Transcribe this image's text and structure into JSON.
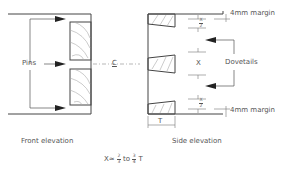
{
  "diagram": {
    "type": "technical-drawing",
    "labels": {
      "pins": "Pins",
      "centerline": "C",
      "dovetails": "Dovetails",
      "margin_top": "4mm margin",
      "margin_bottom": "4mm margin",
      "x_half_top_num": "X",
      "x_half_top_den": "2",
      "x_middle": "X",
      "x_half_bottom_num": "X",
      "x_half_bottom_den": "2",
      "thickness": "T",
      "front_caption": "Front elevation",
      "side_caption": "Side elevation"
    },
    "formula": {
      "prefix": "X≈",
      "frac1_num": "2",
      "frac1_den": "3",
      "mid": "to",
      "frac2_num": "3",
      "frac2_den": "4",
      "suffix": "T"
    },
    "colors": {
      "line": "#444444",
      "hatch": "#999999",
      "text": "#555555"
    }
  }
}
